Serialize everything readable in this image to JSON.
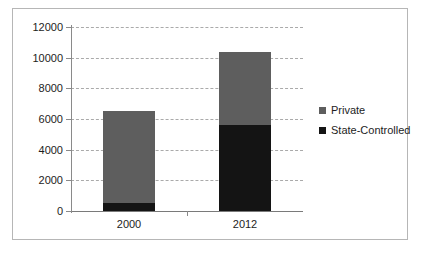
{
  "chart_data": {
    "type": "bar",
    "subtype": "stacked-bar",
    "title": "",
    "subtitle": "",
    "xlabel": "",
    "ylabel": "",
    "categories": [
      "2000",
      "2012"
    ],
    "series": [
      {
        "name": "State-Controlled",
        "color": "#141414",
        "values": [
          500,
          5600
        ]
      },
      {
        "name": "Private",
        "color": "#5e5e5e",
        "values": [
          6000,
          4800
        ]
      }
    ],
    "totals": [
      6500,
      10400
    ],
    "ylim": [
      0,
      12000
    ],
    "ytick_step": 2000,
    "yticks": [
      0,
      2000,
      4000,
      6000,
      8000,
      10000,
      12000
    ],
    "ytick_labels": [
      "0",
      "2000",
      "4000",
      "6000",
      "8000",
      "10000",
      "12000"
    ],
    "grid": true,
    "grid_style": "dashed",
    "grid_axis": "y",
    "legend_position": "right",
    "legend_order": [
      "Private",
      "State-Controlled"
    ],
    "stack_order_bottom_to_top": [
      "State-Controlled",
      "Private"
    ]
  },
  "figure": {
    "border_color": "#b6b6b6",
    "background": "#ffffff",
    "axis_color": "#7a7a7a",
    "gridline_color": "#aaaaaa",
    "text_color": "#1d1d1d"
  },
  "legend": {
    "items": [
      {
        "label": "Private",
        "color": "#5e5e5e",
        "swatch_name": "legend-swatch-private"
      },
      {
        "label": "State-Controlled",
        "color": "#141414",
        "swatch_name": "legend-swatch-state-controlled"
      }
    ]
  }
}
